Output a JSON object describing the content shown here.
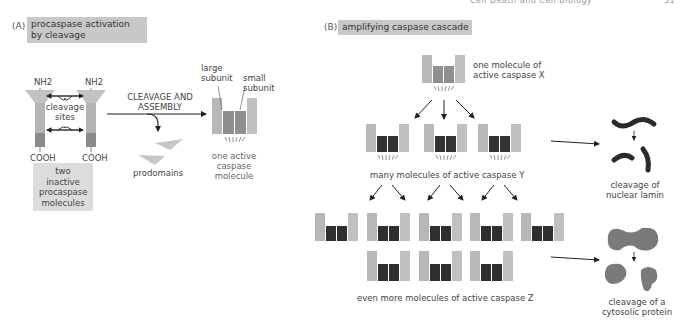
{
  "page_header": {
    "running_title": "Cell Death and Cell Biology",
    "page_number": "31"
  },
  "panel_a": {
    "letter": "(A)",
    "title_line1": "procaspase activation",
    "title_line2": "by cleavage",
    "nh2_left": "NH2",
    "nh2_right": "NH2",
    "cleavage_line1": "cleavage",
    "cleavage_line2": "sites",
    "cooh_left": "COOH",
    "cooh_right": "COOH",
    "inactive_caption_line1": "two inactive",
    "inactive_caption_line2": "procaspase",
    "inactive_caption_line3": "molecules",
    "arrow_label_line1": "CLEAVAGE AND",
    "arrow_label_line2": "ASSEMBLY",
    "prodomains": "prodomains",
    "large_subunit_line1": "large",
    "large_subunit_line2": "subunit",
    "small_subunit_line1": "small",
    "small_subunit_line2": "subunit",
    "active_caption_line1": "one active",
    "active_caption_line2": "caspase",
    "active_caption_line3": "molecule"
  },
  "panel_b": {
    "letter": "(B)",
    "title": "amplifying caspase cascade",
    "x_label_line1": "one molecule of",
    "x_label_line2": "active caspase X",
    "y_label": "many molecules of active caspase Y",
    "z_label": "even more molecules of active caspase Z",
    "lamin_line1": "cleavage of",
    "lamin_line2": "nuclear lamin",
    "cyto_line1": "cleavage of a",
    "cyto_line2": "cytosolic protein"
  },
  "colors": {
    "prodomain": "#c2c2c2",
    "large_subunit": "#b4b4b4",
    "procaspase_small": "#8a8a8a",
    "active_small_x": "#8f8f8f",
    "small_subunit_dark": "#2f2f2f",
    "title_box": "#c8c8c8",
    "caption_box": "#dcdcdc",
    "substrate": "#7a7a7a",
    "lamin": "#2a2a2a"
  }
}
